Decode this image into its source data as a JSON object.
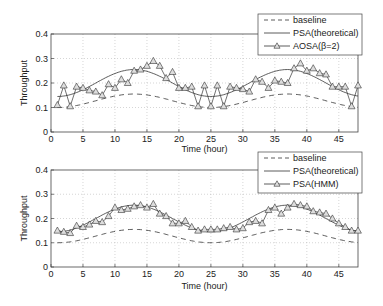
{
  "chart_data": [
    {
      "type": "line",
      "xlabel": "Time (hour)",
      "ylabel": "Throughput",
      "xlim": [
        0,
        48
      ],
      "ylim": [
        0,
        0.4
      ],
      "xticks": [
        0,
        5,
        10,
        15,
        20,
        25,
        30,
        35,
        40,
        45
      ],
      "yticks": [
        0,
        0.1,
        0.2,
        0.3,
        0.4
      ],
      "ytick_labels": [
        "0",
        "0.1",
        "0.2",
        "0.3",
        "0.4"
      ],
      "grid": true,
      "legend_position": "upper right (outside top)",
      "legend": [
        "baseline",
        "PSA(theoretical)",
        "AOSA(β=2)"
      ],
      "series": [
        {
          "name": "baseline",
          "style": "dashed",
          "description": "sinusoid between 0.10 and 0.155, peaks near hour 13 and 37"
        },
        {
          "name": "PSA(theoretical)",
          "style": "solid",
          "description": "sinusoid between 0.145 and 0.255, peaks near hour 13 and 37"
        },
        {
          "name": "AOSA(β=2)",
          "style": "solid-triangle",
          "x": [
            1,
            2,
            3,
            4,
            5,
            6,
            7,
            8,
            9,
            10,
            11,
            12,
            13,
            14,
            15,
            16,
            17,
            18,
            19,
            20,
            21,
            22,
            23,
            24,
            25,
            26,
            27,
            28,
            29,
            30,
            31,
            32,
            33,
            34,
            35,
            36,
            37,
            38,
            39,
            40,
            41,
            42,
            43,
            44,
            45,
            46,
            47,
            48
          ],
          "values": [
            0.11,
            0.19,
            0.105,
            0.185,
            0.18,
            0.17,
            0.165,
            0.15,
            0.195,
            0.18,
            0.215,
            0.2,
            0.25,
            0.255,
            0.27,
            0.29,
            0.27,
            0.22,
            0.245,
            0.18,
            0.18,
            0.185,
            0.105,
            0.19,
            0.105,
            0.19,
            0.105,
            0.185,
            0.18,
            0.175,
            0.165,
            0.215,
            0.205,
            0.18,
            0.21,
            0.205,
            0.2,
            0.26,
            0.28,
            0.25,
            0.26,
            0.24,
            0.235,
            0.185,
            0.185,
            0.185,
            0.105,
            0.19
          ]
        }
      ]
    },
    {
      "type": "line",
      "xlabel": "Time (hour)",
      "ylabel": "Throughput",
      "xlim": [
        0,
        48
      ],
      "ylim": [
        0,
        0.4
      ],
      "xticks": [
        0,
        5,
        10,
        15,
        20,
        25,
        30,
        35,
        40,
        45
      ],
      "yticks": [
        0,
        0.1,
        0.2,
        0.3,
        0.4
      ],
      "ytick_labels": [
        "0",
        "0.1",
        "0.2",
        "0.3",
        "0.4"
      ],
      "grid": true,
      "legend_position": "upper right (outside top)",
      "legend": [
        "baseline",
        "PSA(theoretical)",
        "PSA(HMM)"
      ],
      "series": [
        {
          "name": "baseline",
          "style": "dashed",
          "description": "sinusoid between 0.10 and 0.155, peaks near hour 13 and 37"
        },
        {
          "name": "PSA(theoretical)",
          "style": "solid",
          "description": "sinusoid between 0.145 and 0.255, peaks near hour 13 and 37"
        },
        {
          "name": "PSA(HMM)",
          "style": "solid-triangle",
          "x": [
            1,
            2,
            3,
            4,
            5,
            6,
            7,
            8,
            9,
            10,
            11,
            12,
            13,
            14,
            15,
            16,
            17,
            18,
            19,
            20,
            21,
            22,
            23,
            24,
            25,
            26,
            27,
            28,
            29,
            30,
            31,
            32,
            33,
            34,
            35,
            36,
            37,
            38,
            39,
            40,
            41,
            42,
            43,
            44,
            45,
            46,
            47,
            48
          ],
          "values": [
            0.15,
            0.145,
            0.14,
            0.17,
            0.165,
            0.175,
            0.19,
            0.185,
            0.21,
            0.245,
            0.235,
            0.24,
            0.25,
            0.255,
            0.245,
            0.26,
            0.22,
            0.21,
            0.18,
            0.18,
            0.19,
            0.165,
            0.15,
            0.155,
            0.155,
            0.155,
            0.16,
            0.165,
            0.155,
            0.16,
            0.185,
            0.19,
            0.18,
            0.235,
            0.245,
            0.22,
            0.245,
            0.26,
            0.255,
            0.25,
            0.23,
            0.225,
            0.22,
            0.2,
            0.18,
            0.165,
            0.15,
            0.15
          ]
        }
      ]
    }
  ],
  "plots": [
    {
      "legend": {
        "baseline": "baseline",
        "theoretical": "PSA(theoretical)",
        "third": "AOSA(β=2)"
      },
      "xlabel": "Time (hour)",
      "ylabel": "Throughput"
    },
    {
      "legend": {
        "baseline": "baseline",
        "theoretical": "PSA(theoretical)",
        "third": "PSA(HMM)"
      },
      "xlabel": "Time (hour)",
      "ylabel": "Throughput"
    }
  ],
  "axis": {
    "xticks": [
      "0",
      "5",
      "10",
      "15",
      "20",
      "25",
      "30",
      "35",
      "40",
      "45"
    ],
    "yticks": [
      "0",
      "0.1",
      "0.2",
      "0.3",
      "0.4"
    ]
  }
}
